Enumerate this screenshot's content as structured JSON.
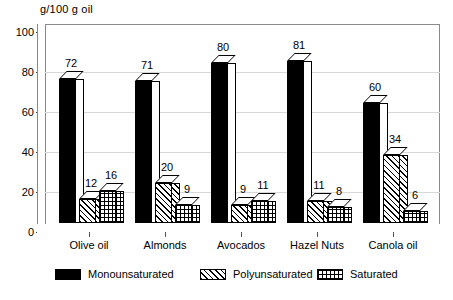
{
  "chart_data": {
    "type": "bar",
    "title": "g/100 g oil",
    "xlabel": "",
    "ylabel": "g/100 g oil",
    "ylim": [
      0,
      100
    ],
    "yticks": [
      0,
      20,
      40,
      60,
      80,
      100
    ],
    "grid": true,
    "legend_position": "bottom",
    "style": "3d-grouped-bar",
    "categories": [
      "Olive oil",
      "Almonds",
      "Avocados",
      "Hazel Nuts",
      "Canola oil"
    ],
    "series": [
      {
        "name": "Monounsaturated",
        "pattern": "solid",
        "values": [
          72,
          71,
          80,
          81,
          60
        ]
      },
      {
        "name": "Polyunsaturated",
        "pattern": "diagonal",
        "values": [
          12,
          20,
          9,
          11,
          34
        ]
      },
      {
        "name": "Saturated",
        "pattern": "grid",
        "values": [
          16,
          9,
          11,
          8,
          6
        ]
      }
    ]
  },
  "axis": {
    "unit_title": "g/100 g oil",
    "ytick_labels": [
      "100",
      "80",
      "60",
      "40",
      "20",
      "0"
    ]
  },
  "legend": {
    "items": [
      {
        "label": "Monounsaturated"
      },
      {
        "label": "Polyunsaturated"
      },
      {
        "label": "Saturated"
      }
    ]
  },
  "colors": {
    "solid": "#000000",
    "background": "#ffffff",
    "frame": "#8a8a8a",
    "gridline": "#d8d8d8",
    "text": "#000000"
  }
}
